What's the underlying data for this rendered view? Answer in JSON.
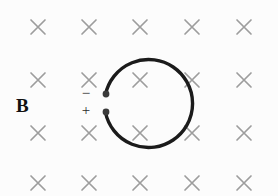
{
  "figure": {
    "name": "current-loop-in-magnetic-field",
    "background_color": "#fcfcfc",
    "width": 278,
    "height": 196
  },
  "field": {
    "label": "B",
    "label_description": "magnetic field label",
    "symbol": "x",
    "symbol_meaning": "field into the page",
    "color": "#9d9d9d",
    "columns_x": [
      38,
      89,
      140,
      192,
      244
    ],
    "rows_y": [
      27,
      80,
      133,
      183
    ],
    "mark_half_size": 7,
    "marks": [
      {
        "row": 0,
        "col": 0,
        "cx": 38,
        "cy": 27
      },
      {
        "row": 0,
        "col": 1,
        "cx": 89,
        "cy": 27
      },
      {
        "row": 0,
        "col": 2,
        "cx": 140,
        "cy": 27
      },
      {
        "row": 0,
        "col": 3,
        "cx": 192,
        "cy": 27
      },
      {
        "row": 0,
        "col": 4,
        "cx": 244,
        "cy": 27
      },
      {
        "row": 1,
        "col": 0,
        "cx": 38,
        "cy": 80
      },
      {
        "row": 1,
        "col": 1,
        "cx": 89,
        "cy": 80
      },
      {
        "row": 1,
        "col": 2,
        "cx": 140,
        "cy": 80
      },
      {
        "row": 1,
        "col": 3,
        "cx": 192,
        "cy": 80
      },
      {
        "row": 1,
        "col": 4,
        "cx": 244,
        "cy": 80
      },
      {
        "row": 2,
        "col": 0,
        "cx": 38,
        "cy": 133
      },
      {
        "row": 2,
        "col": 1,
        "cx": 89,
        "cy": 133
      },
      {
        "row": 2,
        "col": 2,
        "cx": 140,
        "cy": 133
      },
      {
        "row": 2,
        "col": 3,
        "cx": 192,
        "cy": 133
      },
      {
        "row": 2,
        "col": 4,
        "cx": 244,
        "cy": 133
      },
      {
        "row": 3,
        "col": 0,
        "cx": 38,
        "cy": 183
      },
      {
        "row": 3,
        "col": 1,
        "cx": 89,
        "cy": 183
      },
      {
        "row": 3,
        "col": 2,
        "cx": 140,
        "cy": 183
      },
      {
        "row": 3,
        "col": 3,
        "cx": 192,
        "cy": 183
      },
      {
        "row": 3,
        "col": 4,
        "cx": 244,
        "cy": 183
      }
    ]
  },
  "loop": {
    "color": "#1b1b1b",
    "stroke_width": 3.4,
    "center": {
      "x": 128,
      "y": 103
    },
    "radius": 44,
    "gap_side": "left",
    "arc_path": "M 105.5 94.5 A 44 44 0 1 1 105.5 112.5",
    "terminals": [
      {
        "name": "negative-terminal",
        "cx": 106,
        "cy": 94,
        "r": 3.4,
        "color": "#3a3a3a"
      },
      {
        "name": "positive-terminal",
        "cx": 106,
        "cy": 112,
        "r": 3.4,
        "color": "#3a3a3a"
      }
    ],
    "polarity": {
      "negative": "−",
      "positive": "+"
    }
  }
}
